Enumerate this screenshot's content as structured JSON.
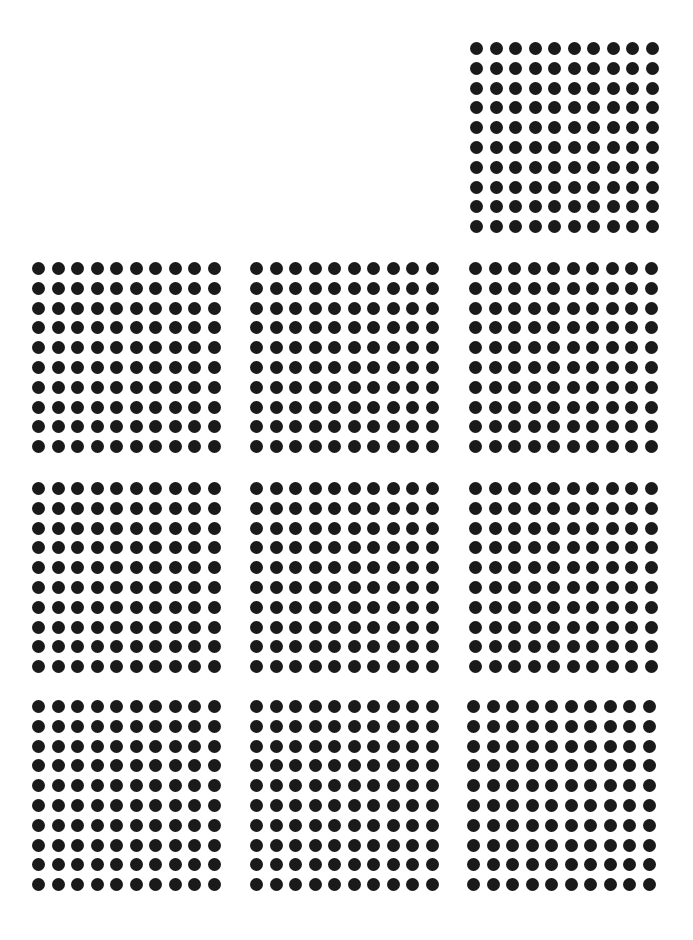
{
  "diagram": {
    "dot_color": "#1a1a1a",
    "background": "#ffffff",
    "rows_per_block": 10,
    "cols_per_block": 10,
    "dots_per_block": 100,
    "total_blocks": 10,
    "total_dots": 1000,
    "blocks": [
      {
        "id": "block-1",
        "row": 0,
        "col": 2,
        "x": 470,
        "y": 42
      },
      {
        "id": "block-2",
        "row": 1,
        "col": 0,
        "x": 32,
        "y": 262
      },
      {
        "id": "block-3",
        "row": 1,
        "col": 1,
        "x": 250,
        "y": 262
      },
      {
        "id": "block-4",
        "row": 1,
        "col": 2,
        "x": 469,
        "y": 262
      },
      {
        "id": "block-5",
        "row": 2,
        "col": 0,
        "x": 32,
        "y": 482
      },
      {
        "id": "block-6",
        "row": 2,
        "col": 1,
        "x": 250,
        "y": 482
      },
      {
        "id": "block-7",
        "row": 2,
        "col": 2,
        "x": 469,
        "y": 482
      },
      {
        "id": "block-8",
        "row": 3,
        "col": 0,
        "x": 32,
        "y": 700
      },
      {
        "id": "block-9",
        "row": 3,
        "col": 1,
        "x": 250,
        "y": 700
      },
      {
        "id": "block-10",
        "row": 3,
        "col": 2,
        "x": 467,
        "y": 700
      }
    ]
  }
}
